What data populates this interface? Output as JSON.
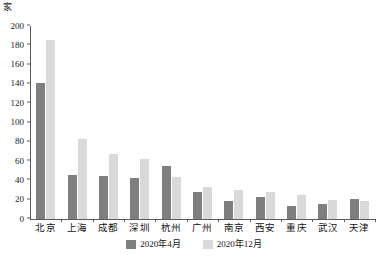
{
  "chart_data": {
    "type": "bar",
    "title": "",
    "subtitle": "",
    "unit_label": "家",
    "xlabel": "",
    "ylabel": "",
    "ylim": [
      0,
      200
    ],
    "yticks": [
      0,
      20,
      40,
      60,
      80,
      100,
      120,
      140,
      160,
      180,
      200
    ],
    "grid": false,
    "legend_position": "bottom-center",
    "categories": [
      "北京",
      "上海",
      "成都",
      "深圳",
      "杭州",
      "广州",
      "南京",
      "西安",
      "重庆",
      "武汉",
      "天津"
    ],
    "series": [
      {
        "name": "2020年4月",
        "color": "#7f7f7f",
        "values": [
          141,
          46,
          45,
          42,
          55,
          28,
          19,
          23,
          13,
          16,
          21
        ]
      },
      {
        "name": "2020年12月",
        "color": "#d9d9d9",
        "values": [
          185,
          83,
          67,
          62,
          44,
          33,
          30,
          28,
          25,
          20,
          19
        ]
      }
    ]
  },
  "colors": {
    "series_1": "#7f7f7f",
    "series_2": "#d9d9d9",
    "axis": "#5c5c5c",
    "text": "#111111",
    "background": "#ffffff"
  }
}
